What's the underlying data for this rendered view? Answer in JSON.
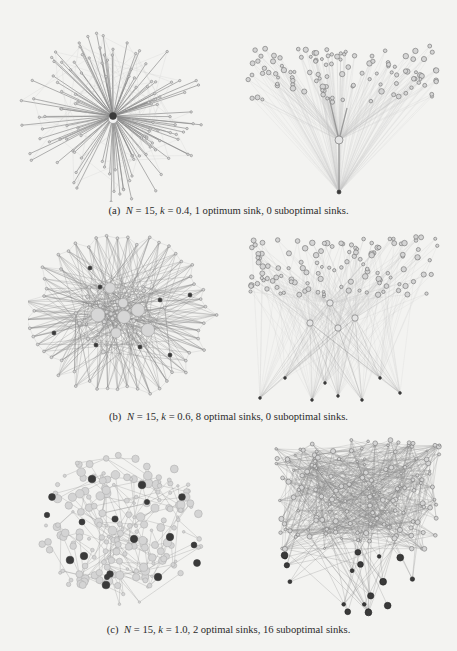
{
  "figure": {
    "rows": [
      {
        "id": "a",
        "caption": {
          "label": "(a)",
          "N": "15",
          "k": "0.4",
          "optimal_text": "1 optimum sink",
          "suboptimal_text": "0 suboptimal sinks."
        },
        "left_graph": {
          "layout": "star",
          "seed": 3,
          "nodes": 120,
          "optimal_sinks": 1,
          "suboptimal_sinks": 0
        },
        "right_graph": {
          "layout": "fan",
          "seed": 7,
          "nodes": 110,
          "optimal_sinks": 1,
          "suboptimal_sinks": 0
        }
      },
      {
        "id": "b",
        "caption": {
          "label": "(b)",
          "N": "15",
          "k": "0.6",
          "optimal_text": "8 optimal sinks",
          "suboptimal_text": "0 suboptimal sinks."
        },
        "left_graph": {
          "layout": "dense-star",
          "seed": 11,
          "nodes": 110,
          "optimal_sinks": 8,
          "suboptimal_sinks": 0
        },
        "right_graph": {
          "layout": "fan-multi",
          "seed": 13,
          "nodes": 120,
          "optimal_sinks": 8,
          "suboptimal_sinks": 0
        }
      },
      {
        "id": "c",
        "caption": {
          "label": "(c)",
          "N": "15",
          "k": "1.0",
          "optimal_text": "2 optimal sinks",
          "suboptimal_text": "16 suboptimal sinks."
        },
        "left_graph": {
          "layout": "blob",
          "seed": 17,
          "nodes": 180,
          "optimal_sinks": 2,
          "suboptimal_sinks": 16
        },
        "right_graph": {
          "layout": "tangle",
          "seed": 19,
          "nodes": 150,
          "optimal_sinks": 2,
          "suboptimal_sinks": 16
        }
      }
    ],
    "colors": {
      "background": "#f3f3f1",
      "edge": "#8a8a8a",
      "edge_light": "#c4c4c4",
      "node_fill": "#d4d4d4",
      "node_stroke": "#8c8c8c",
      "sink": "#3a3a3a"
    }
  }
}
